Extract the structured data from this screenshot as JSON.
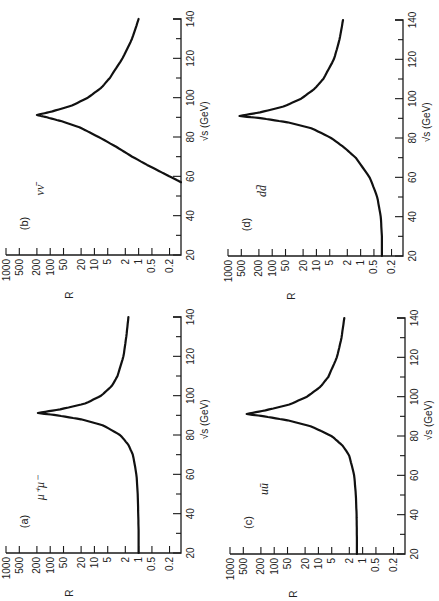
{
  "figure": {
    "rotation_deg": -90,
    "note_visible": "Figure printed rotated 90 degrees"
  },
  "chart_data": [
    {
      "type": "line",
      "panel": "(a)",
      "channel": "μ⁺μ⁻",
      "title": "(a) μ⁺μ⁻",
      "xlabel": "√s (GeV)",
      "ylabel": "R",
      "xscale": "linear",
      "yscale": "log",
      "xlim": [
        20,
        140
      ],
      "ylim": [
        0.11,
        1000
      ],
      "x_ticks": [
        20,
        40,
        60,
        80,
        100,
        120,
        140
      ],
      "x_minor_ticks": [
        30,
        50,
        70,
        90,
        110,
        130
      ],
      "y_ticks": [
        "1000",
        "500",
        "200",
        "100",
        "50",
        "20",
        "10",
        "5",
        "2",
        "1",
        "0.5",
        "0.2"
      ],
      "grid": false,
      "x": [
        20,
        30,
        40,
        50,
        60,
        70,
        75,
        80,
        85,
        88,
        90,
        91.2,
        93,
        96,
        100,
        105,
        110,
        120,
        130,
        140
      ],
      "y": [
        1.0,
        1.0,
        1.02,
        1.05,
        1.12,
        1.35,
        1.7,
        2.6,
        6.5,
        20,
        70,
        190,
        60,
        16,
        7,
        4,
        3,
        2.2,
        1.9,
        1.7
      ]
    },
    {
      "type": "line",
      "panel": "(b)",
      "channel": "νν̄",
      "title": "(b) νν̄",
      "xlabel": "√s (GeV)",
      "ylabel": "R",
      "xscale": "linear",
      "yscale": "log",
      "xlim": [
        20,
        140
      ],
      "ylim": [
        0.11,
        1000
      ],
      "x_ticks": [
        20,
        40,
        60,
        80,
        100,
        120,
        140
      ],
      "x_minor_ticks": [
        30,
        50,
        70,
        90,
        110,
        130
      ],
      "y_ticks": [
        "1000",
        "500",
        "200",
        "100",
        "50",
        "20",
        "10",
        "5",
        "2",
        "1",
        "0.5",
        "0.2"
      ],
      "grid": false,
      "x": [
        57,
        60,
        65,
        70,
        75,
        80,
        85,
        88,
        90,
        91.2,
        93,
        96,
        100,
        105,
        110,
        120,
        130,
        140
      ],
      "y": [
        0.11,
        0.2,
        0.55,
        1.4,
        3.2,
        8,
        22,
        55,
        120,
        200,
        90,
        32,
        14,
        7,
        4.5,
        2.3,
        1.4,
        1.0
      ]
    },
    {
      "type": "line",
      "panel": "(c)",
      "channel": "uū",
      "title": "(c) uū",
      "xlabel": "√s (GeV)",
      "ylabel": "R",
      "xscale": "linear",
      "yscale": "log",
      "xlim": [
        20,
        140
      ],
      "ylim": [
        0.11,
        1000
      ],
      "x_ticks": [
        20,
        40,
        60,
        80,
        100,
        120,
        140
      ],
      "x_minor_ticks": [
        30,
        50,
        70,
        90,
        110,
        130
      ],
      "y_ticks": [
        "1000",
        "500",
        "200",
        "100",
        "50",
        "20",
        "10",
        "5",
        "2",
        "1",
        "0.5",
        "0.2"
      ],
      "grid": false,
      "x": [
        20,
        30,
        40,
        50,
        60,
        70,
        75,
        80,
        85,
        88,
        90,
        91.2,
        93,
        96,
        100,
        105,
        110,
        120,
        130,
        140
      ],
      "y": [
        1.35,
        1.35,
        1.37,
        1.42,
        1.55,
        2.0,
        2.8,
        5,
        15,
        50,
        170,
        420,
        160,
        45,
        18,
        9,
        6,
        3.8,
        3.0,
        2.6
      ]
    },
    {
      "type": "line",
      "panel": "(d)",
      "channel": "dd̄",
      "title": "(d) dd̄",
      "xlabel": "√s (GeV)",
      "ylabel": "R",
      "xscale": "linear",
      "yscale": "log",
      "xlim": [
        20,
        140
      ],
      "ylim": [
        0.11,
        1000
      ],
      "x_ticks": [
        20,
        40,
        60,
        80,
        100,
        120,
        140
      ],
      "x_minor_ticks": [
        30,
        50,
        70,
        90,
        110,
        130
      ],
      "y_ticks": [
        "1000",
        "500",
        "200",
        "100",
        "50",
        "20",
        "10",
        "5",
        "2",
        "1",
        "0.5",
        "0.2"
      ],
      "grid": false,
      "x": [
        20,
        30,
        40,
        50,
        60,
        70,
        75,
        80,
        85,
        88,
        90,
        91.2,
        93,
        96,
        100,
        105,
        110,
        120,
        130,
        140
      ],
      "y": [
        0.33,
        0.33,
        0.35,
        0.42,
        0.62,
        1.3,
        2.3,
        4.6,
        13,
        45,
        170,
        550,
        190,
        55,
        22,
        11,
        7,
        4.0,
        3.0,
        2.5
      ]
    }
  ],
  "layout": {
    "panels": [
      {
        "key": "a",
        "frame": {
          "left": 0,
          "top": 303
        }
      },
      {
        "key": "b",
        "frame": {
          "left": 0,
          "top": 5
        }
      },
      {
        "key": "c",
        "frame": {
          "left": 224,
          "top": 304
        }
      },
      {
        "key": "d",
        "frame": {
          "left": 222,
          "top": 6
        }
      }
    ]
  }
}
